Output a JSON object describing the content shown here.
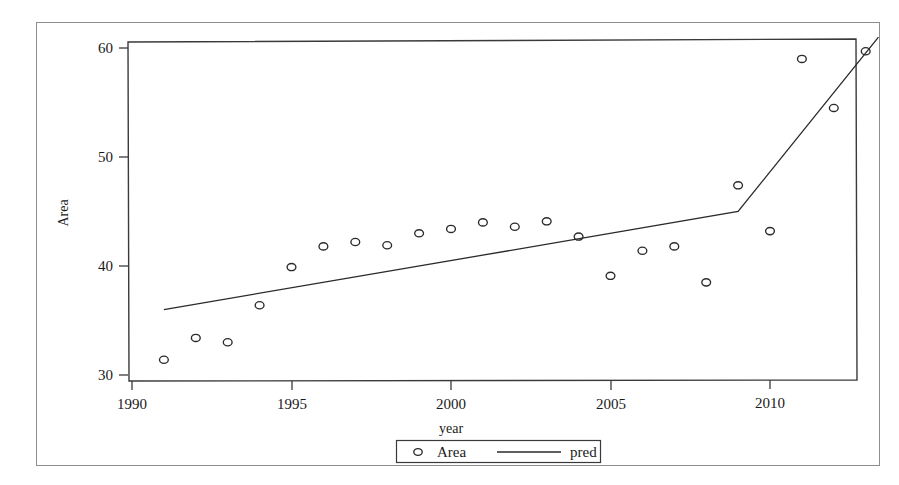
{
  "figure": {
    "has_outer_frame": true,
    "background_color": "#ffffff",
    "ink_color": "#2a2a2a"
  },
  "axis": {
    "x_title": "year",
    "y_title": "Area",
    "x_ticks": [
      "1990",
      "1995",
      "2000",
      "2005",
      "2010"
    ],
    "y_ticks": [
      "30",
      "40",
      "50",
      "60"
    ]
  },
  "legend": {
    "items": [
      {
        "label": "Area",
        "symbol": "open-circle-marker"
      },
      {
        "label": "pred",
        "symbol": "solid-line"
      }
    ]
  },
  "chart_data": {
    "type": "scatter",
    "title": "",
    "xlabel": "year",
    "ylabel": "Area",
    "xlim": [
      1990,
      2013.5
    ],
    "ylim": [
      29.0,
      61.2
    ],
    "xticks": [
      1990,
      1995,
      2000,
      2005,
      2010
    ],
    "yticks": [
      30,
      40,
      50,
      60
    ],
    "grid": false,
    "legend_position": "bottom-center",
    "x": [
      1991,
      1992,
      1993,
      1994,
      1995,
      1996,
      1997,
      1998,
      1999,
      2000,
      2001,
      2002,
      2003,
      2004,
      2005,
      2006,
      2007,
      2008,
      2009,
      2010,
      2011,
      2012,
      2013
    ],
    "series": [
      {
        "name": "Area",
        "type": "scatter",
        "marker": "open-circle",
        "values": [
          31.4,
          33.4,
          33.0,
          36.4,
          39.9,
          41.8,
          42.2,
          41.9,
          43.0,
          43.4,
          44.0,
          43.6,
          44.1,
          42.7,
          39.1,
          41.4,
          41.8,
          38.5,
          47.4,
          43.2,
          59.0,
          54.5,
          59.7
        ]
      },
      {
        "name": "pred",
        "type": "line",
        "x": [
          1991,
          2009,
          2013.4
        ],
        "values": [
          36.0,
          45.0,
          61.0
        ]
      }
    ]
  }
}
